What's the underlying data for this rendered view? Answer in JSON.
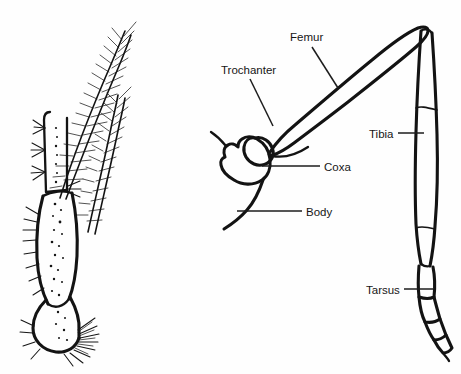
{
  "figure": {
    "background_color": "#ffffff",
    "ink_color": "#131313",
    "width": 461,
    "height": 374
  },
  "panels": [
    {
      "id": "left-panel",
      "name": "detailed-leg-drawing",
      "caption": "",
      "description": "Stippled and setose distal leg segments with plumose bristles"
    },
    {
      "id": "right-panel",
      "name": "labeled-leg-schematic",
      "caption": "",
      "description": "Outline schematic of a complete insect leg with part labels"
    }
  ],
  "labels": [
    {
      "id": "femur",
      "text": "Femur",
      "x": 290,
      "y": 41,
      "anchor": "start",
      "leader": {
        "x1": 312,
        "y1": 47,
        "x2": 338,
        "y2": 88
      }
    },
    {
      "id": "trochanter",
      "text": "Trochanter",
      "x": 221,
      "y": 74,
      "anchor": "start",
      "leader": {
        "x1": 250,
        "y1": 79,
        "x2": 273,
        "y2": 126
      }
    },
    {
      "id": "coxa",
      "text": "Coxa",
      "x": 324,
      "y": 171,
      "anchor": "start",
      "leader": {
        "x1": 262,
        "y1": 166,
        "x2": 320,
        "y2": 166
      }
    },
    {
      "id": "body",
      "text": "Body",
      "x": 306,
      "y": 216,
      "anchor": "start",
      "leader": {
        "x1": 237,
        "y1": 211,
        "x2": 302,
        "y2": 211
      }
    },
    {
      "id": "tibia",
      "text": "Tibia",
      "x": 369,
      "y": 138,
      "anchor": "start",
      "leader": {
        "x1": 398,
        "y1": 133,
        "x2": 424,
        "y2": 133
      }
    },
    {
      "id": "tarsus",
      "text": "Tarsus",
      "x": 366,
      "y": 294,
      "anchor": "start",
      "leader": {
        "x1": 404,
        "y1": 289,
        "x2": 433,
        "y2": 289
      }
    }
  ]
}
